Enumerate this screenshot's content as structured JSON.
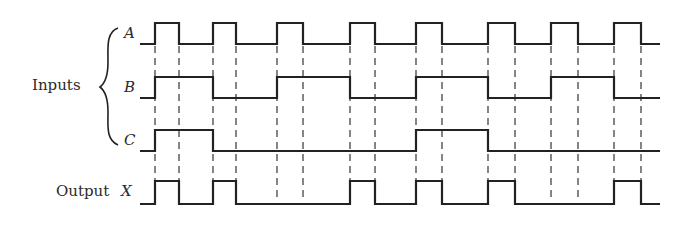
{
  "labels": {
    "inputs": "Inputs",
    "output": "Output",
    "signals": [
      "A",
      "B",
      "C"
    ],
    "output_signal": "X"
  },
  "colors": {
    "ink": "#222222",
    "background": "#ffffff"
  },
  "timing": {
    "x_start": 140,
    "x_end": 660,
    "edges": [
      155,
      179,
      213,
      236,
      277,
      303,
      350,
      375,
      416,
      442,
      488,
      515,
      551,
      578,
      614,
      641
    ],
    "levels": {
      "A": {
        "high": 23,
        "low": 44
      },
      "B": {
        "high": 77,
        "low": 98
      },
      "C": {
        "high": 130,
        "low": 151
      },
      "X": {
        "high": 181,
        "low": 204
      }
    },
    "waveforms": {
      "A": {
        "initial": 0,
        "segments": [
          [
            155,
            1
          ],
          [
            179,
            0
          ],
          [
            213,
            1
          ],
          [
            236,
            0
          ],
          [
            277,
            1
          ],
          [
            303,
            0
          ],
          [
            350,
            1
          ],
          [
            375,
            0
          ],
          [
            416,
            1
          ],
          [
            442,
            0
          ],
          [
            488,
            1
          ],
          [
            515,
            0
          ],
          [
            551,
            1
          ],
          [
            578,
            0
          ],
          [
            614,
            1
          ],
          [
            641,
            0
          ]
        ]
      },
      "B": {
        "initial": 0,
        "segments": [
          [
            155,
            1
          ],
          [
            213,
            0
          ],
          [
            277,
            1
          ],
          [
            350,
            0
          ],
          [
            416,
            1
          ],
          [
            488,
            0
          ],
          [
            551,
            1
          ],
          [
            614,
            0
          ]
        ]
      },
      "C": {
        "initial": 0,
        "segments": [
          [
            155,
            1
          ],
          [
            213,
            0
          ],
          [
            416,
            1
          ],
          [
            488,
            0
          ]
        ]
      },
      "X": {
        "initial": 0,
        "segments": [
          [
            155,
            1
          ],
          [
            179,
            0
          ],
          [
            213,
            1
          ],
          [
            236,
            0
          ],
          [
            350,
            1
          ],
          [
            375,
            0
          ],
          [
            416,
            1
          ],
          [
            442,
            0
          ],
          [
            488,
            1
          ],
          [
            515,
            0
          ],
          [
            614,
            1
          ],
          [
            641,
            0
          ]
        ]
      }
    },
    "dashed_guides": {
      "y_top": 46,
      "y_bottom": 198
    }
  }
}
